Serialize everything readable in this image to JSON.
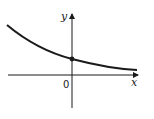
{
  "diagram": {
    "type": "function-graph",
    "axes": {
      "x_label": "x",
      "y_label": "y",
      "origin_label": "0"
    },
    "curve": {
      "shape": "decreasing-exponential",
      "marked_point": "y-intercept"
    },
    "colors": {
      "line": "#1a1a1a",
      "background": "#ffffff"
    }
  }
}
